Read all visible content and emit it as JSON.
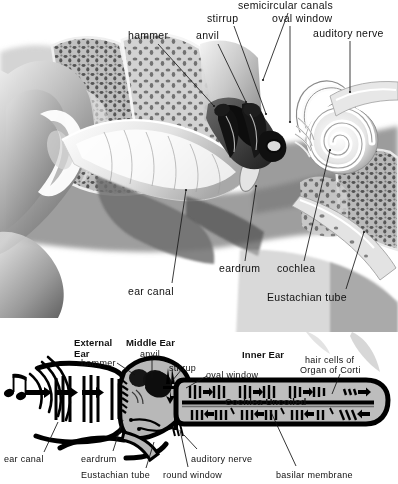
{
  "figure": {
    "style": "grayscale medical illustration with labeled leader lines above a black-and-white schematic cross-section"
  },
  "top_illustration": {
    "name": "cutaway-drawing-of-the-ear",
    "labels": [
      {
        "id": "hammer",
        "text": "hammer",
        "x": 128,
        "y": 36,
        "anchor": "start",
        "line": [
          [
            166,
            46
          ],
          [
            218,
            108
          ]
        ]
      },
      {
        "id": "anvil",
        "text": "anvil",
        "x": 196,
        "y": 36,
        "anchor": "start",
        "line": [
          [
            224,
            46
          ],
          [
            248,
            104
          ]
        ]
      },
      {
        "id": "stirrup",
        "text": "stirrup",
        "x": 207,
        "y": 18,
        "anchor": "start",
        "line": [
          [
            236,
            28
          ],
          [
            268,
            116
          ]
        ]
      },
      {
        "id": "semicircular-canals",
        "text": "semicircular canals",
        "x": 241,
        "y": 5,
        "anchor": "start",
        "line": [
          [
            290,
            14
          ],
          [
            262,
            80
          ]
        ]
      },
      {
        "id": "oval-window",
        "text": "oval window",
        "x": 272,
        "y": 18,
        "anchor": "start",
        "line": [
          [
            290,
            28
          ],
          [
            290,
            122
          ]
        ]
      },
      {
        "id": "auditory-nerve",
        "text": "auditory nerve",
        "x": 315,
        "y": 32,
        "anchor": "start",
        "line": [
          [
            351,
            42
          ],
          [
            351,
            92
          ]
        ]
      },
      {
        "id": "ear-canal",
        "text": "ear canal",
        "x": 130,
        "y": 289,
        "anchor": "start",
        "line": [
          [
            173,
            286
          ],
          [
            186,
            188
          ]
        ]
      },
      {
        "id": "eardrum",
        "text": "eardrum",
        "x": 221,
        "y": 267,
        "anchor": "start",
        "line": [
          [
            247,
            264
          ],
          [
            258,
            186
          ]
        ]
      },
      {
        "id": "cochlea",
        "text": "cochlea",
        "x": 278,
        "y": 267,
        "anchor": "start",
        "line": [
          [
            305,
            264
          ],
          [
            330,
            148
          ]
        ]
      },
      {
        "id": "eustachian-tube",
        "text": "Eustachian tube",
        "x": 268,
        "y": 296,
        "anchor": "start",
        "line": [
          [
            348,
            292
          ],
          [
            364,
            230
          ]
        ]
      }
    ]
  },
  "bottom_schematic": {
    "name": "uncoiled-ear-schematic",
    "section_headings": [
      {
        "id": "external-ear",
        "text": "External\nEar",
        "line1": "External",
        "line2": "Ear",
        "x": 75,
        "y": 5
      },
      {
        "id": "middle-ear",
        "text": "Middle Ear",
        "x": 128,
        "y": 5
      },
      {
        "id": "inner-ear",
        "text": "Inner Ear",
        "x": 243,
        "y": 17
      },
      {
        "id": "cochlea-uncoiled",
        "text": "Cochlea Uncoiled",
        "x": 226,
        "y": 64
      }
    ],
    "labels": [
      {
        "id": "hammer",
        "text": "hammer",
        "x": 82,
        "y": 26,
        "line": [
          [
            117,
            31
          ],
          [
            135,
            43
          ]
        ]
      },
      {
        "id": "anvil",
        "text": "anvil",
        "x": 142,
        "y": 17,
        "line": [
          [
            152,
            27
          ],
          [
            152,
            46
          ]
        ]
      },
      {
        "id": "stirrup",
        "text": "stirrup",
        "x": 171,
        "y": 31,
        "line": [
          [
            182,
            37
          ],
          [
            172,
            49
          ]
        ]
      },
      {
        "id": "oval-window",
        "text": "oval window",
        "x": 208,
        "y": 38,
        "line": [
          [
            207,
            44
          ],
          [
            186,
            56
          ]
        ]
      },
      {
        "id": "hair-cells-1",
        "text": "hair cells of",
        "x": 306,
        "y": 23
      },
      {
        "id": "hair-cells-2",
        "text": "Organ of Corti",
        "x": 302,
        "y": 33,
        "line": [
          [
            340,
            42
          ],
          [
            332,
            62
          ]
        ]
      },
      {
        "id": "ear-canal",
        "text": "ear canal",
        "x": 4,
        "y": 122,
        "line": [
          [
            44,
            120
          ],
          [
            58,
            90
          ]
        ]
      },
      {
        "id": "eardrum",
        "text": "eardrum",
        "x": 82,
        "y": 122,
        "line": [
          [
            113,
            119
          ],
          [
            123,
            88
          ]
        ]
      },
      {
        "id": "eustachian-tube",
        "text": "Eustachian tube",
        "x": 82,
        "y": 139,
        "line": [
          [
            146,
            136
          ],
          [
            154,
            110
          ]
        ]
      },
      {
        "id": "round-window",
        "text": "round window",
        "x": 164,
        "y": 139,
        "line": [
          [
            188,
            135
          ],
          [
            180,
            98
          ]
        ]
      },
      {
        "id": "auditory-nerve",
        "text": "auditory nerve",
        "x": 192,
        "y": 122,
        "line": [
          [
            197,
            117
          ],
          [
            184,
            103
          ]
        ]
      },
      {
        "id": "basilar-membrane",
        "text": "basilar membrane",
        "x": 277,
        "y": 139,
        "line": [
          [
            296,
            134
          ],
          [
            270,
            78
          ]
        ]
      }
    ]
  },
  "colors": {
    "ink": "#000000",
    "paper": "#ffffff",
    "mid_gray": "#9a9a9a",
    "light_gray": "#c9c9c9",
    "dark_gray": "#4a4a4a",
    "bone_gray": "#b5b5b5"
  }
}
